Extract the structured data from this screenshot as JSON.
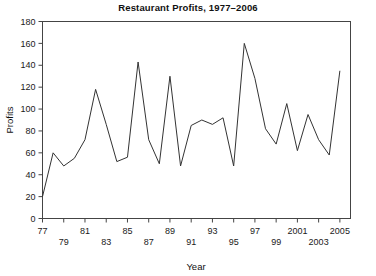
{
  "chart_data": {
    "type": "line",
    "title": "Restaurant Profits, 1977–2006",
    "xlabel": "Year",
    "ylabel": "Profits",
    "grid": false,
    "legend": false,
    "xlim": [
      1977,
      2006
    ],
    "ylim": [
      0,
      180
    ],
    "ytick_step": 20,
    "xtick_step": 2,
    "yticks": [
      0,
      20,
      40,
      60,
      80,
      100,
      120,
      140,
      160,
      180
    ],
    "ytick_labels": [
      "0",
      "20",
      "40",
      "60",
      "80",
      "100",
      "120",
      "140",
      "160",
      "180"
    ],
    "xticks": [
      1977,
      1979,
      1981,
      1983,
      1985,
      1987,
      1989,
      1991,
      1993,
      1995,
      1997,
      1999,
      2001,
      2003,
      2005
    ],
    "xtick_labels": [
      "77",
      "79",
      "81",
      "83",
      "85",
      "87",
      "89",
      "91",
      "93",
      "95",
      "97",
      "99",
      "2001",
      "2003",
      "2005"
    ],
    "xtick_rows": [
      0,
      1,
      0,
      1,
      0,
      1,
      0,
      1,
      0,
      1,
      0,
      1,
      0,
      1,
      0
    ],
    "series": [
      {
        "name": "Profits",
        "color": "#333333",
        "x": [
          1977,
          1978,
          1979,
          1980,
          1981,
          1982,
          1983,
          1984,
          1985,
          1986,
          1987,
          1988,
          1989,
          1990,
          1991,
          1992,
          1993,
          1994,
          1995,
          1996,
          1997,
          1998,
          1999,
          2000,
          2001,
          2002,
          2003,
          2004,
          2005
        ],
        "values": [
          20,
          60,
          48,
          55,
          72,
          118,
          86,
          52,
          56,
          143,
          72,
          50,
          130,
          48,
          85,
          90,
          86,
          92,
          48,
          160,
          128,
          82,
          68,
          105,
          62,
          95,
          72,
          58,
          135
        ]
      }
    ]
  },
  "axes": {
    "ylabel_text": "Profits",
    "xlabel_text": "Year"
  }
}
